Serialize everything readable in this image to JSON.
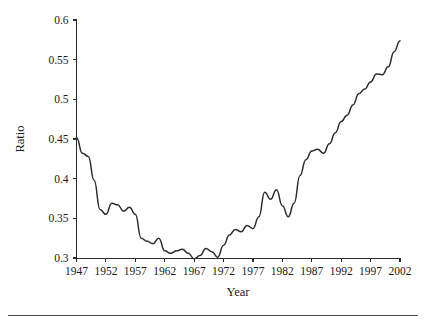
{
  "chart_data": {
    "type": "line",
    "title": "",
    "xlabel": "Year",
    "ylabel": "Ratio",
    "xlim": [
      1947,
      2002
    ],
    "ylim": [
      0.3,
      0.6
    ],
    "grid": false,
    "legend": null,
    "xticks": [
      1947,
      1952,
      1957,
      1962,
      1967,
      1972,
      1977,
      1982,
      1987,
      1992,
      1997,
      2002
    ],
    "xtick_labels": [
      "1947",
      "1952",
      "1957",
      "1962",
      "1967",
      "1972",
      "1977",
      "1982",
      "1987",
      "1992",
      "1997",
      "2002"
    ],
    "yticks": [
      0.3,
      0.35,
      0.4,
      0.45,
      0.5,
      0.55,
      0.6
    ],
    "ytick_labels": [
      "0.3",
      "0.35",
      "0.4",
      "0.45",
      "0.5",
      "0.55",
      "0.6"
    ],
    "line_color": "#2e2e2e",
    "x": [
      1947,
      1948,
      1949,
      1950,
      1951,
      1952,
      1953,
      1954,
      1955,
      1956,
      1957,
      1958,
      1959,
      1960,
      1961,
      1962,
      1963,
      1964,
      1965,
      1966,
      1967,
      1968,
      1969,
      1970,
      1971,
      1972,
      1973,
      1974,
      1975,
      1976,
      1977,
      1978,
      1979,
      1980,
      1981,
      1982,
      1983,
      1984,
      1985,
      1986,
      1987,
      1988,
      1989,
      1990,
      1991,
      1992,
      1993,
      1994,
      1995,
      1996,
      1997,
      1998,
      1999,
      2000,
      2001,
      2002
    ],
    "values": [
      0.452,
      0.432,
      0.428,
      0.398,
      0.361,
      0.355,
      0.369,
      0.367,
      0.359,
      0.364,
      0.355,
      0.325,
      0.321,
      0.318,
      0.325,
      0.309,
      0.306,
      0.309,
      0.311,
      0.306,
      0.299,
      0.303,
      0.312,
      0.308,
      0.301,
      0.316,
      0.329,
      0.336,
      0.333,
      0.341,
      0.337,
      0.352,
      0.383,
      0.374,
      0.386,
      0.366,
      0.352,
      0.369,
      0.404,
      0.424,
      0.435,
      0.437,
      0.432,
      0.444,
      0.458,
      0.472,
      0.48,
      0.493,
      0.507,
      0.513,
      0.522,
      0.532,
      0.531,
      0.541,
      0.56,
      0.574
    ]
  },
  "footer": {
    "rule_color": "#4a4a4a"
  }
}
